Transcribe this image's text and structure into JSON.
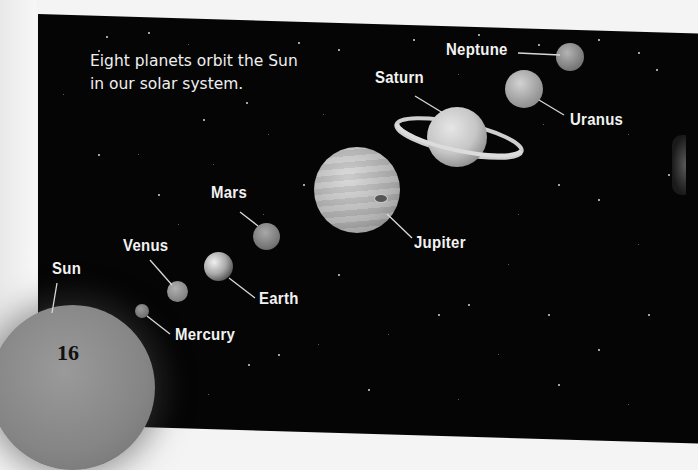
{
  "page": {
    "number": "16",
    "margin_dots": "•••"
  },
  "intro_text": {
    "line1": "Eight planets orbit the Sun",
    "line2": "in our solar system."
  },
  "bodies": [
    {
      "name": "Sun",
      "label": "Sun",
      "color": "#8c8c8c"
    },
    {
      "name": "Mercury",
      "label": "Mercury",
      "color": "#7a7a7a"
    },
    {
      "name": "Venus",
      "label": "Venus",
      "color": "#9a9a9a"
    },
    {
      "name": "Earth",
      "label": "Earth",
      "color": "#b8b8b8"
    },
    {
      "name": "Mars",
      "label": "Mars",
      "color": "#8e8e8e"
    },
    {
      "name": "Jupiter",
      "label": "Jupiter",
      "color": "#bdbdbd"
    },
    {
      "name": "Saturn",
      "label": "Saturn",
      "color": "#cfcfcf"
    },
    {
      "name": "Uranus",
      "label": "Uranus",
      "color": "#b6b6b6"
    },
    {
      "name": "Neptune",
      "label": "Neptune",
      "color": "#9a9a9a"
    }
  ],
  "colors": {
    "space": "#050505",
    "page": "#f4f4f4",
    "label_text": "#f2f2f2",
    "leader_line": "#d8d8d8"
  }
}
